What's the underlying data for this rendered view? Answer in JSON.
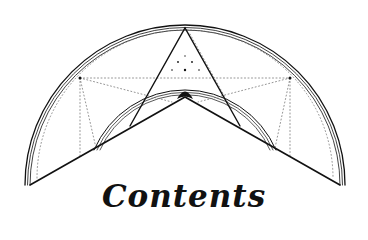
{
  "page": {
    "title": "Contents"
  },
  "colors": {
    "ink": "#111111",
    "background": "#ffffff",
    "dotted": "#777777"
  },
  "emblem": {
    "description": "semicircular geometric emblem with triangle, chevron, inner arcs and dotted construction lines",
    "icon": "geometric-emblem-icon"
  }
}
